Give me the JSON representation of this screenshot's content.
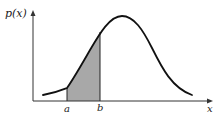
{
  "diagram": {
    "type": "probability-density-curve",
    "y_axis_label": "p(x)",
    "x_axis_label": "x",
    "interval_start_label": "a",
    "interval_end_label": "b",
    "shaded_region": "area under p(x) between a and b",
    "colors": {
      "curve": "#111111",
      "axes": "#333333",
      "shade": "#a8a8a8",
      "background": "#ffffff"
    }
  }
}
